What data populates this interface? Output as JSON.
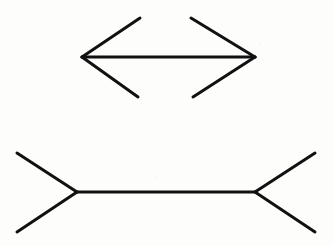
{
  "figure": {
    "background_color": "#fdfdfc",
    "line_color": "#111111",
    "line_width": 3,
    "canvas": {
      "width": 333,
      "height": 246
    }
  },
  "chart_data": {
    "type": "diagram",
    "xlabel": "",
    "ylabel": "",
    "shapes": [
      {
        "name": "arrowheads-inward-figure",
        "description": "Horizontal shaft with inward-pointing arrowhead fins at both ends (appears shorter)",
        "shaft": {
          "x1": 82,
          "y1": 57,
          "x2": 255,
          "y2": 57,
          "length": 173
        },
        "fins": [
          {
            "name": "left-upper-fin",
            "x1": 82,
            "y1": 57,
            "x2": 140,
            "y2": 18
          },
          {
            "name": "left-lower-fin",
            "x1": 82,
            "y1": 57,
            "x2": 138,
            "y2": 97
          },
          {
            "name": "right-upper-fin",
            "x1": 255,
            "y1": 57,
            "x2": 191,
            "y2": 18
          },
          {
            "name": "right-lower-fin",
            "x1": 255,
            "y1": 57,
            "x2": 193,
            "y2": 97
          }
        ]
      },
      {
        "name": "arrowtails-outward-figure",
        "description": "Horizontal shaft with outward-pointing tail fins at both ends (appears longer)",
        "shaft": {
          "x1": 77,
          "y1": 192,
          "x2": 255,
          "y2": 192,
          "length": 178
        },
        "fins": [
          {
            "name": "left-upper-fin",
            "x1": 77,
            "y1": 192,
            "x2": 17,
            "y2": 153
          },
          {
            "name": "left-lower-fin",
            "x1": 77,
            "y1": 192,
            "x2": 17,
            "y2": 232
          },
          {
            "name": "right-upper-fin",
            "x1": 255,
            "y1": 192,
            "x2": 315,
            "y2": 153
          },
          {
            "name": "right-lower-fin",
            "x1": 255,
            "y1": 192,
            "x2": 315,
            "y2": 232
          }
        ]
      }
    ]
  }
}
